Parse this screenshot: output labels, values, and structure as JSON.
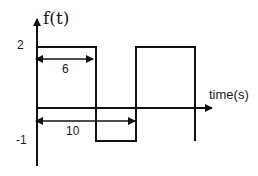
{
  "diagram": {
    "type": "square-wave signal plot",
    "y_axis_label": "f(t)",
    "x_axis_label": "time(s)",
    "y_ticks": [
      {
        "label": "2",
        "value": 2
      },
      {
        "label": "-1",
        "value": -1
      }
    ],
    "dimensions": [
      {
        "label": "6",
        "meaning": "high-level duration"
      },
      {
        "label": "10",
        "meaning": "period"
      }
    ],
    "segments": [
      {
        "level": 2,
        "from": 0,
        "to": 6
      },
      {
        "level": -1,
        "from": 6,
        "to": 10
      },
      {
        "level": 2,
        "from": 10,
        "to": 16
      },
      {
        "level": -1,
        "from": 16
      }
    ],
    "colors": {
      "line": "#111111",
      "background": "#ffffff"
    }
  }
}
